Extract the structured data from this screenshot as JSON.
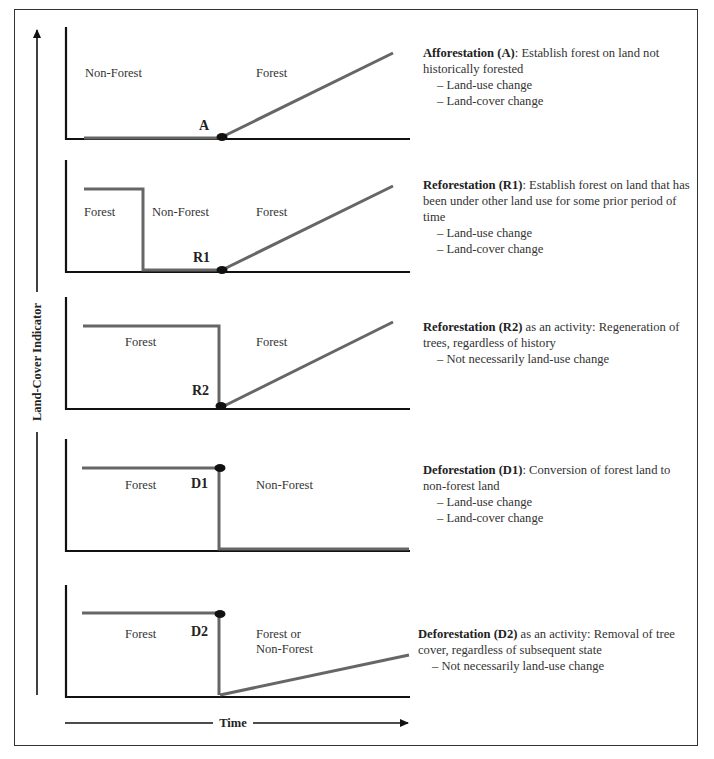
{
  "axes": {
    "y_label": "Land-Cover Indicator",
    "x_label": "Time"
  },
  "panels": [
    {
      "id": "A",
      "code": "A",
      "region_labels": [
        "Non-Forest",
        "Forest"
      ],
      "term": "Afforestation (A)",
      "definition": ": Establish forest on land not historically forested",
      "bullets": [
        "Land-use change",
        "Land-cover change"
      ]
    },
    {
      "id": "R1",
      "code": "R1",
      "region_labels": [
        "Forest",
        "Non-Forest",
        "Forest"
      ],
      "term": "Reforestation (R1)",
      "definition": ": Establish forest on land that has been under other land use for some prior period of time",
      "bullets": [
        "Land-use change",
        "Land-cover change"
      ]
    },
    {
      "id": "R2",
      "code": "R2",
      "region_labels": [
        "Forest",
        "Forest"
      ],
      "term": "Reforestation (R2)",
      "definition": " as an activity: Regeneration of trees, regardless of history",
      "bullets": [
        "Not necessarily land-use change"
      ]
    },
    {
      "id": "D1",
      "code": "D1",
      "region_labels": [
        "Forest",
        "Non-Forest"
      ],
      "term": "Deforestation (D1)",
      "definition": ": Conversion of forest land to non-forest land",
      "bullets": [
        "Land-use change",
        "Land-cover change"
      ]
    },
    {
      "id": "D2",
      "code": "D2",
      "region_labels": [
        "Forest",
        "Forest or",
        "Non-Forest"
      ],
      "term": "Deforestation (D2)",
      "definition": " as an activity: Removal of tree cover, regardless of subsequent state",
      "bullets": [
        "Not necessarily land-use change"
      ]
    }
  ],
  "colors": {
    "frame": "#333333",
    "axis": "#1a1a1a",
    "trajectory": "#666666",
    "event_dot": "#111111"
  }
}
